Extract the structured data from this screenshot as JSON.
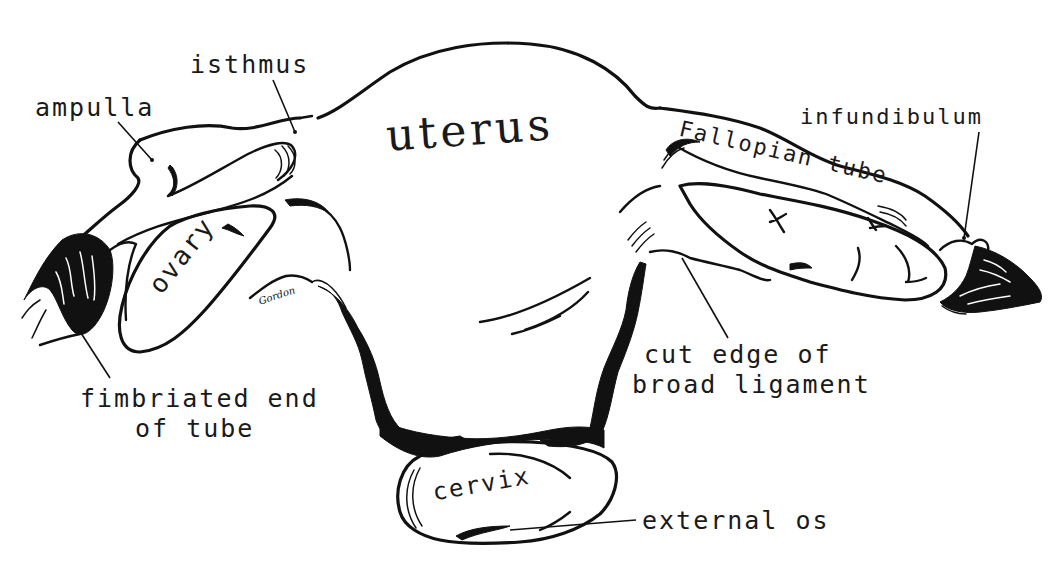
{
  "diagram": {
    "style": "black ink line drawing on white",
    "colors": {
      "ink": "#111111",
      "background": "#ffffff"
    },
    "organ_labels": {
      "uterus": "uterus",
      "ovary": "ovary",
      "cervix": "cervix",
      "fallopian_tube": "Fallopian tube"
    },
    "callout_labels": {
      "ampulla": "ampulla",
      "isthmus": "isthmus",
      "infundibulum": "infundibulum",
      "fimbriated_end_line1": "fimbriated end",
      "fimbriated_end_line2": "of tube",
      "cut_edge_line1": "cut edge of",
      "cut_edge_line2": "broad ligament",
      "external_os": "external os"
    },
    "signature": "Gordon"
  }
}
